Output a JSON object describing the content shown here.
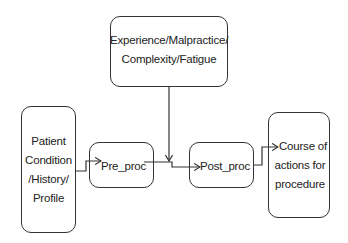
{
  "diagram": {
    "nodes": [
      {
        "id": "factors",
        "label_lines": [
          "Experience/Malpractice/",
          "Complexity/Fatigue"
        ]
      },
      {
        "id": "patient",
        "label_lines": [
          "Patient",
          "Condition",
          "/History/",
          "Profile"
        ]
      },
      {
        "id": "pre_proc",
        "label": "Pre_proc"
      },
      {
        "id": "post_proc",
        "label": "Post_proc"
      },
      {
        "id": "course",
        "label_lines": [
          "Course of",
          "actions for",
          "procedure"
        ]
      }
    ],
    "edges": [
      {
        "from": "patient",
        "to": "pre_proc"
      },
      {
        "from": "factors",
        "to": "pre_proc->post_proc link"
      },
      {
        "from": "pre_proc",
        "to": "post_proc"
      },
      {
        "from": "post_proc",
        "to": "course"
      }
    ]
  }
}
